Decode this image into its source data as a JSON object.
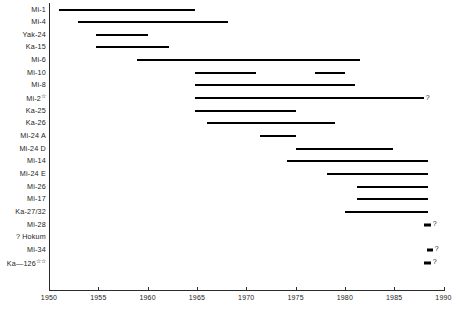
{
  "chart_data": {
    "type": "bar",
    "chart_style": "gantt-timeline",
    "title": "",
    "xlabel": "",
    "ylabel": "",
    "xlim": [
      1950,
      1990
    ],
    "xticks": [
      1950,
      1955,
      1960,
      1965,
      1970,
      1975,
      1980,
      1985,
      1990
    ],
    "xtick_labels": [
      "1950",
      "1955",
      "1960",
      "1965",
      "1970",
      "1975",
      "1980",
      "1985",
      "1990"
    ],
    "grid": false,
    "legend": "none",
    "categories": [
      "Mi-1",
      "Mi-4",
      "Yak-24",
      "Ka-15",
      "Mi-6",
      "Mi-10",
      "Mi-8",
      "Mi-2",
      "Ka-25",
      "Ka-26",
      "Mi-24A",
      "Mi-24D",
      "Mi-14",
      "Mi-24E",
      "Mi-26",
      "Mi-17",
      "Ka-27/32",
      "Mi-28",
      "? Hokum",
      "Mi-34",
      "Ka—126"
    ],
    "rows": [
      {
        "label": "Mi-1",
        "marker": "",
        "prefix": "",
        "spans": [
          [
            1951.0,
            1964.8
          ]
        ],
        "uncertain": false
      },
      {
        "label": "Mi-4",
        "marker": "",
        "prefix": "",
        "spans": [
          [
            1952.9,
            1968.1
          ]
        ],
        "uncertain": false
      },
      {
        "label": "Yak-24",
        "marker": "",
        "prefix": "",
        "spans": [
          [
            1954.8,
            1960.0
          ]
        ],
        "uncertain": false
      },
      {
        "label": "Ka-15",
        "marker": "",
        "prefix": "",
        "spans": [
          [
            1954.8,
            1962.2
          ]
        ],
        "uncertain": false
      },
      {
        "label": "Mi-6",
        "marker": "",
        "prefix": "",
        "spans": [
          [
            1958.9,
            1981.5
          ]
        ],
        "uncertain": false
      },
      {
        "label": "Mi-10",
        "marker": "",
        "prefix": "",
        "spans": [
          [
            1964.8,
            1971.0
          ],
          [
            1977.0,
            1980.0
          ]
        ],
        "uncertain": false
      },
      {
        "label": "Mi-8",
        "marker": "",
        "prefix": "",
        "spans": [
          [
            1964.8,
            1981.0
          ]
        ],
        "uncertain": false
      },
      {
        "label": "Mi-2",
        "marker": "☆",
        "prefix": "",
        "spans": [
          [
            1964.8,
            1988.0
          ]
        ],
        "uncertain": true
      },
      {
        "label": "Ka-25",
        "marker": "",
        "prefix": "",
        "spans": [
          [
            1964.8,
            1975.0
          ]
        ],
        "uncertain": false
      },
      {
        "label": "Ka-26",
        "marker": "",
        "prefix": "",
        "spans": [
          [
            1966.0,
            1979.0
          ]
        ],
        "uncertain": false
      },
      {
        "label": "Mi-24 A",
        "marker": "",
        "prefix": "",
        "spans": [
          [
            1971.4,
            1975.0
          ]
        ],
        "uncertain": false
      },
      {
        "label": "Mi-24 D",
        "marker": "",
        "prefix": "",
        "spans": [
          [
            1975.0,
            1984.9
          ]
        ],
        "uncertain": false
      },
      {
        "label": "Mi-14",
        "marker": "",
        "prefix": "",
        "spans": [
          [
            1974.1,
            1988.4
          ]
        ],
        "uncertain": false
      },
      {
        "label": "Mi-24 E",
        "marker": "",
        "prefix": "",
        "spans": [
          [
            1978.2,
            1988.4
          ]
        ],
        "uncertain": false
      },
      {
        "label": "Mi-26",
        "marker": "",
        "prefix": "",
        "spans": [
          [
            1981.2,
            1988.4
          ]
        ],
        "uncertain": false
      },
      {
        "label": "Mi-17",
        "marker": "",
        "prefix": "",
        "spans": [
          [
            1981.2,
            1988.4
          ]
        ],
        "uncertain": false
      },
      {
        "label": "Ka-27/32",
        "marker": "",
        "prefix": "",
        "spans": [
          [
            1980.0,
            1988.4
          ]
        ],
        "uncertain": false
      },
      {
        "label": "Mi-28",
        "marker": "",
        "prefix": "",
        "spans": [
          [
            1988.0,
            1988.7
          ]
        ],
        "uncertain": true
      },
      {
        "label": "Hokum",
        "marker": "",
        "prefix": "?",
        "spans": [],
        "uncertain": false
      },
      {
        "label": "Mi-34",
        "marker": "",
        "prefix": "",
        "spans": [
          [
            1988.3,
            1988.9
          ]
        ],
        "uncertain": true
      },
      {
        "label": "Ka—126",
        "marker": "☆☆",
        "prefix": "",
        "spans": [
          [
            1988.0,
            1988.7
          ]
        ],
        "uncertain": true
      }
    ],
    "uncertain_marker": "?",
    "bar_color": "#000000",
    "axis_color": "#2b2b2b"
  }
}
